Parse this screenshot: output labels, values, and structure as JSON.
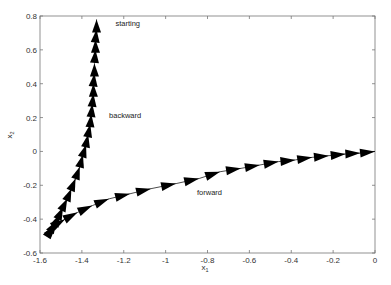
{
  "chart_data": {
    "type": "line",
    "title": "",
    "xlabel": "x1",
    "ylabel": "x2",
    "xlim": [
      -1.6,
      0
    ],
    "ylim": [
      -0.6,
      0.8
    ],
    "grid": false,
    "legend": null,
    "x_ticks": [
      -1.6,
      -1.4,
      -1.2,
      -1,
      -0.8,
      -0.6,
      -0.4,
      -0.2,
      0
    ],
    "x_tick_labels": [
      "-1.6",
      "-1.4",
      "-1.2",
      "-1",
      "-0.8",
      "-0.6",
      "-0.4",
      "-0.2",
      "0"
    ],
    "y_ticks": [
      -0.6,
      -0.4,
      -0.2,
      0,
      0.2,
      0.4,
      0.6,
      0.8
    ],
    "y_tick_labels": [
      "-0.6",
      "-0.4",
      "-0.2",
      "0",
      "0.2",
      "0.4",
      "0.6",
      "0.8"
    ],
    "annotations": [
      {
        "text": "starting",
        "x": -1.24,
        "y": 0.74
      },
      {
        "text": "backward",
        "x": -1.27,
        "y": 0.2
      },
      {
        "text": "forward",
        "x": -0.85,
        "y": -0.26
      }
    ],
    "series": [
      {
        "name": "backward",
        "description": "arrows along trajectory from starting point (top) down to the lower-left corner",
        "points": [
          [
            -1.33,
            0.78
          ],
          [
            -1.33,
            0.72
          ],
          [
            -1.335,
            0.66
          ],
          [
            -1.335,
            0.6
          ],
          [
            -1.34,
            0.52
          ],
          [
            -1.34,
            0.46
          ],
          [
            -1.345,
            0.4
          ],
          [
            -1.345,
            0.34
          ],
          [
            -1.35,
            0.28
          ],
          [
            -1.355,
            0.22
          ],
          [
            -1.36,
            0.16
          ],
          [
            -1.37,
            0.1
          ],
          [
            -1.38,
            0.04
          ],
          [
            -1.395,
            -0.02
          ],
          [
            -1.41,
            -0.09
          ],
          [
            -1.43,
            -0.16
          ],
          [
            -1.45,
            -0.22
          ],
          [
            -1.47,
            -0.28
          ],
          [
            -1.49,
            -0.33
          ],
          [
            -1.505,
            -0.37
          ],
          [
            -1.52,
            -0.41
          ],
          [
            -1.535,
            -0.44
          ],
          [
            -1.545,
            -0.46
          ]
        ],
        "arrow_direction": "toward_start"
      },
      {
        "name": "forward",
        "description": "arrows from lower-left corner curving right to the origin",
        "points": [
          [
            -1.54,
            -0.46
          ],
          [
            -1.52,
            -0.43
          ],
          [
            -1.48,
            -0.4
          ],
          [
            -1.42,
            -0.36
          ],
          [
            -1.35,
            -0.32
          ],
          [
            -1.27,
            -0.28
          ],
          [
            -1.17,
            -0.25
          ],
          [
            -1.07,
            -0.22
          ],
          [
            -0.95,
            -0.19
          ],
          [
            -0.84,
            -0.16
          ],
          [
            -0.74,
            -0.12
          ],
          [
            -0.64,
            -0.1
          ],
          [
            -0.55,
            -0.08
          ],
          [
            -0.46,
            -0.06
          ],
          [
            -0.38,
            -0.05
          ],
          [
            -0.3,
            -0.035
          ],
          [
            -0.22,
            -0.025
          ],
          [
            -0.14,
            -0.015
          ],
          [
            -0.07,
            -0.01
          ],
          [
            0.0,
            0.0
          ]
        ],
        "arrow_direction": "forward"
      }
    ],
    "colors": {
      "arrows": "#000000",
      "axis": "#555555",
      "text": "#333333"
    }
  }
}
